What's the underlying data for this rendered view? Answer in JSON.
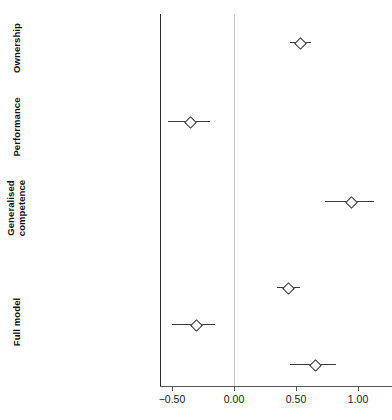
{
  "chart_data": {
    "type": "scatter",
    "title": "",
    "xlabel": "",
    "ylabel": "",
    "xlim": [
      -0.6,
      1.18
    ],
    "grid": false,
    "legend": "none",
    "zero_reference_line": 0.0,
    "xticks": [
      -0.5,
      0.0,
      0.5,
      1.0
    ],
    "xtick_labels": [
      "−0.50",
      "0.00",
      "0.50",
      "1.00"
    ],
    "marker": "open-diamond",
    "groups": [
      {
        "label": "Ownership",
        "rows": [
          {
            "label": "Best party on MIP",
            "estimate": 0.53,
            "ci_low": 0.45,
            "ci_high": 0.62
          }
        ]
      },
      {
        "label": "Performance",
        "rows": [
          {
            "label": "Policy conditions",
            "estimate": -0.36,
            "ci_low": -0.53,
            "ci_high": -0.19
          }
        ]
      },
      {
        "label": "Generalised\ncompetence",
        "rows": [
          {
            "label": "Party handling: all issues",
            "estimate": 0.94,
            "ci_low": 0.73,
            "ci_high": 1.13
          }
        ]
      },
      {
        "label": "Full model",
        "rows": [
          {
            "label": "Best party on MIP",
            "estimate": 0.43,
            "ci_low": 0.35,
            "ci_high": 0.53
          },
          {
            "label": "Policy conditions",
            "estimate": -0.31,
            "ci_low": -0.5,
            "ci_high": -0.15
          },
          {
            "label": "Party handling: all issues",
            "estimate": 0.65,
            "ci_low": 0.45,
            "ci_high": 0.82
          }
        ]
      }
    ]
  },
  "axis": {
    "tick_labels": [
      "−0.50",
      "0.00",
      "0.50",
      "1.00"
    ]
  },
  "rows": [
    {
      "label": "Best party on MIP",
      "y": 43,
      "estimate": 0.53,
      "ci_low": 0.45,
      "ci_high": 0.62
    },
    {
      "label": "Policy conditions",
      "y": 122,
      "estimate": -0.36,
      "ci_low": -0.53,
      "ci_high": -0.19
    },
    {
      "label": "Party handling: all issues",
      "y": 202,
      "estimate": 0.94,
      "ci_low": 0.73,
      "ci_high": 1.13
    },
    {
      "label": "Best party on MIP",
      "y": 288,
      "estimate": 0.43,
      "ci_low": 0.35,
      "ci_high": 0.53
    },
    {
      "label": "Policy conditions",
      "y": 325,
      "estimate": -0.31,
      "ci_low": -0.5,
      "ci_high": -0.15
    },
    {
      "label": "Party handling: all issues",
      "y": 365,
      "estimate": 0.65,
      "ci_low": 0.45,
      "ci_high": 0.82
    }
  ],
  "groups": [
    {
      "label": "Ownership",
      "cy": 48,
      "multiline": false
    },
    {
      "label": "Performance",
      "cy": 127,
      "multiline": false
    },
    {
      "label": "Generalised\ncompetence",
      "cy": 208,
      "multiline": true
    },
    {
      "label": "Full model",
      "cy": 322,
      "multiline": false
    }
  ],
  "colors": {
    "marker_stroke": "#2b2b2b",
    "marker_fill": "#ffffff",
    "ci_line": "#3a3a3a",
    "axis": "#555555",
    "panel_rule": "#2b2b2b",
    "zero_line": "#c9c9c9",
    "background": "#ffffff",
    "text": "#1a1a1a"
  }
}
